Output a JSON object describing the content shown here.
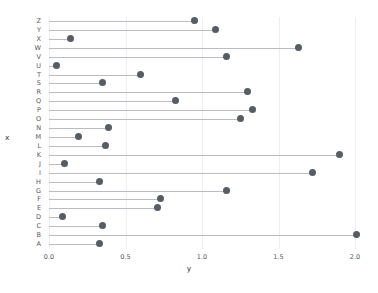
{
  "chart_data": {
    "type": "scatter",
    "subtype": "lollipop-horizontal",
    "title": "",
    "xlabel": "y",
    "ylabel": "x",
    "xlim": [
      0.0,
      2.1
    ],
    "xticks": [
      "0.0",
      "0.5",
      "1.0",
      "1.5",
      "2.0"
    ],
    "xtick_values": [
      0.0,
      0.5,
      1.0,
      1.5,
      2.0
    ],
    "grid": "vertical",
    "legend": "none",
    "baseline": 0.0,
    "marker_color": "#555d66",
    "stem_color": "#b9bcc0",
    "grid_color": "#eceef0",
    "categories": [
      "Z",
      "Y",
      "X",
      "W",
      "V",
      "U",
      "T",
      "S",
      "R",
      "Q",
      "P",
      "O",
      "N",
      "M",
      "L",
      "K",
      "J",
      "I",
      "H",
      "G",
      "F",
      "E",
      "D",
      "C",
      "B",
      "A"
    ],
    "values": [
      0.95,
      1.09,
      0.14,
      1.63,
      1.16,
      0.05,
      0.6,
      0.35,
      1.3,
      0.83,
      1.33,
      1.25,
      0.39,
      0.19,
      0.37,
      1.9,
      0.1,
      1.72,
      0.33,
      1.16,
      0.73,
      0.71,
      0.09,
      0.35,
      2.01,
      0.33
    ]
  }
}
